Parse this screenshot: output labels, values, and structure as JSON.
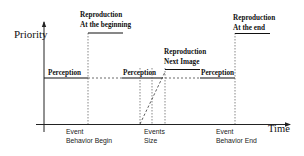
{
  "diagram": {
    "y_axis_label": "Priority",
    "x_axis_label": "Time",
    "levels": {
      "perception": "Perception",
      "reproduction_beginning": [
        "Reproduction",
        "At the beginning"
      ],
      "reproduction_next": [
        "Reproduction",
        "Next Image"
      ],
      "reproduction_end": [
        "Reproduction",
        "At the end"
      ]
    },
    "perception_labels": [
      "Perception",
      "Perception",
      "Perception"
    ],
    "events": [
      {
        "id": "begin",
        "lines": [
          "Event",
          "Behavior Begin"
        ]
      },
      {
        "id": "size",
        "lines": [
          "Events",
          "Size"
        ]
      },
      {
        "id": "end",
        "lines": [
          "Event",
          "Behavior End"
        ]
      }
    ]
  }
}
